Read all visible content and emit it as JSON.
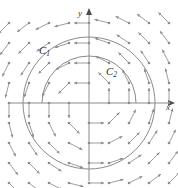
{
  "figure": {
    "background_color": "#ffffff",
    "width": 178,
    "height": 188
  },
  "axes": {
    "x_label": "x",
    "y_label": "y",
    "color": "#8a8a8a",
    "origin": {
      "x": 89,
      "y": 103
    },
    "x_axis_from": {
      "x": 8,
      "y": 103
    },
    "x_axis_to": {
      "x": 172,
      "y": 103
    },
    "y_axis_from": {
      "x": 89,
      "y": 181
    },
    "y_axis_to": {
      "x": 89,
      "y": 11
    }
  },
  "curves": [
    {
      "name": "C1",
      "label_text": "C",
      "label_sub": "1",
      "type": "circle",
      "center": {
        "x": 89,
        "y": 103
      },
      "radius": 66,
      "arc": "full",
      "color": "#7d7d7d"
    },
    {
      "name": "C2",
      "label_text": "C",
      "label_sub": "2",
      "type": "semicircle",
      "center": {
        "x": 89,
        "y": 103
      },
      "radius": 47,
      "arc": "upper-half",
      "color": "#7d7d7d"
    }
  ],
  "vector_field": {
    "description": "Counterclockwise rotational field; arrow direction is perpendicular to the radius vector",
    "arrow_color": "#8c8c8c",
    "tail_dot_color": "#8c8c8c",
    "spacing": 20,
    "arrow_length": 15,
    "grid_x": [
      9,
      29,
      49,
      69,
      89,
      109,
      129,
      149,
      169
    ],
    "grid_y": [
      23,
      43,
      63,
      83,
      103,
      123,
      143,
      163,
      183
    ]
  },
  "chart_data": {
    "type": "scatter",
    "xlabel": "x",
    "ylabel": "y",
    "legend": [
      "C1",
      "C2"
    ],
    "annotations": [
      "C1",
      "C2",
      "x",
      "y"
    ]
  }
}
